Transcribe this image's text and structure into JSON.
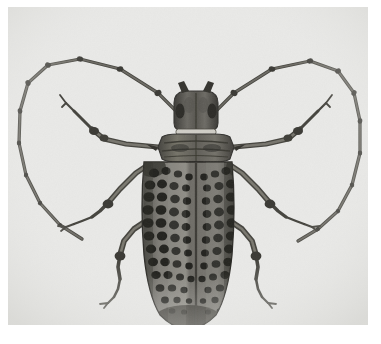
{
  "image": {
    "type": "photograph",
    "subject": "longhorn beetle",
    "family": "Cerambycidae",
    "view": "dorsal",
    "rendering": "grayscale halftone print",
    "caption": "",
    "background_color": "#e9e9e7",
    "page_color": "#ffffff",
    "body_dark_color": "#3a3a38",
    "body_mid_color": "#6d6c68",
    "body_light_color": "#9a9893",
    "spot_color": "#24241f",
    "outline_color": "#45443f",
    "frame": {
      "left": 8,
      "top": 7,
      "width": 360,
      "height": 318
    }
  },
  "specimen": {
    "head": {
      "label": "head",
      "center_x": 188,
      "center_y": 108,
      "eyes_visible": true,
      "mandibles_visible": true
    },
    "pronotum": {
      "label": "pronotum",
      "center_x": 188,
      "center_y": 135,
      "lateral_spines": 2
    },
    "elytra": {
      "label": "elytra",
      "center_x": 188,
      "top_y": 152,
      "bottom_y": 322,
      "width": 104,
      "pattern": "reticulated dark mosaic spots",
      "suture_visible": true,
      "spot_count_estimate": 120
    },
    "antennae": {
      "label": "antennae",
      "count": 2,
      "shape": "long looping segmented",
      "segments_per_antenna": 11,
      "left_loop_extent_px": 300,
      "right_loop_extent_px": 300
    },
    "legs": {
      "label": "legs",
      "count": 6,
      "pairs": [
        "fore",
        "mid",
        "hind"
      ],
      "parts": [
        "femur",
        "tibia",
        "tarsus",
        "claw"
      ]
    }
  }
}
